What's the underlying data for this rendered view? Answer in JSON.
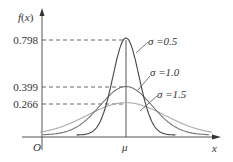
{
  "chart_data": {
    "type": "line",
    "title": "",
    "xlabel": "x",
    "ylabel": "f(x)",
    "origin_label": "O",
    "x_center_label": "μ",
    "y_ticks": [
      "0.798",
      "0.399",
      "0.266"
    ],
    "y_tick_values": [
      0.798,
      0.399,
      0.266
    ],
    "grid": false,
    "series": [
      {
        "name": "σ=0.5",
        "sigma": 0.5,
        "peak": 0.798,
        "color": "#444444"
      },
      {
        "name": "σ=1.0",
        "sigma": 1.0,
        "peak": 0.399,
        "color": "#777777"
      },
      {
        "name": "σ=1.5",
        "sigma": 1.5,
        "peak": 0.266,
        "color": "#aaaaaa"
      }
    ],
    "annotations": [
      "σ=0.5",
      "σ=1.0",
      "σ=1.5"
    ]
  },
  "labels": {
    "ylabel": "f(x)",
    "xlabel": "x",
    "origin": "O",
    "mu": "μ",
    "tick0": "0.798",
    "tick1": "0.399",
    "tick2": "0.266",
    "s05": "σ =0.5",
    "s10": "σ =1.0",
    "s15": "σ =1.5"
  }
}
